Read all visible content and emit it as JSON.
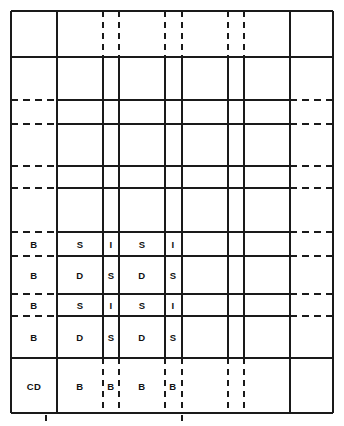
{
  "figure": {
    "title": "",
    "type": "grid-schedule-diagram",
    "width": 344,
    "height": 426,
    "background_color": "#ffffff",
    "line_color": "#1a1a1a",
    "text_color": "#111111"
  },
  "geometry": {
    "border": {
      "x0": 11,
      "y0": 11,
      "x1": 333,
      "y1": 413
    },
    "vertical_lines_x": [
      11,
      57,
      103,
      119,
      165,
      182,
      228,
      244,
      290,
      333
    ],
    "horizontal_lines_y": [
      11,
      57,
      100,
      124,
      166,
      188,
      232,
      256,
      294,
      316,
      358,
      413
    ]
  },
  "columns": [
    {
      "name": "col-1",
      "x0": 11,
      "x1": 57
    },
    {
      "name": "col-2",
      "x0": 57,
      "x1": 103
    },
    {
      "name": "col-3",
      "x0": 103,
      "x1": 119
    },
    {
      "name": "col-4",
      "x0": 119,
      "x1": 165
    },
    {
      "name": "col-5",
      "x0": 165,
      "x1": 182
    },
    {
      "name": "col-6",
      "x0": 182,
      "x1": 228
    },
    {
      "name": "col-7",
      "x0": 228,
      "x1": 244
    },
    {
      "name": "col-8",
      "x0": 244,
      "x1": 290
    },
    {
      "name": "col-9",
      "x0": 290,
      "x1": 333
    }
  ],
  "rows": [
    {
      "name": "row-1",
      "y0": 11,
      "y1": 57
    },
    {
      "name": "row-2",
      "y0": 57,
      "y1": 100
    },
    {
      "name": "row-3",
      "y0": 100,
      "y1": 124
    },
    {
      "name": "row-4",
      "y0": 124,
      "y1": 166
    },
    {
      "name": "row-5",
      "y0": 166,
      "y1": 188
    },
    {
      "name": "row-6",
      "y0": 188,
      "y1": 232
    },
    {
      "name": "row-7",
      "y0": 232,
      "y1": 256
    },
    {
      "name": "row-8",
      "y0": 256,
      "y1": 294
    },
    {
      "name": "row-9",
      "y0": 294,
      "y1": 316
    },
    {
      "name": "row-10",
      "y0": 316,
      "y1": 358
    },
    {
      "name": "row-11",
      "y0": 358,
      "y1": 413
    }
  ],
  "labels": [
    {
      "text": "B",
      "cx": 34,
      "cy": 244
    },
    {
      "text": "S",
      "cx": 80,
      "cy": 244
    },
    {
      "text": "I",
      "cx": 111,
      "cy": 244
    },
    {
      "text": "S",
      "cx": 142,
      "cy": 244
    },
    {
      "text": "I",
      "cx": 173,
      "cy": 244
    },
    {
      "text": "B",
      "cx": 34,
      "cy": 275
    },
    {
      "text": "D",
      "cx": 80,
      "cy": 275
    },
    {
      "text": "S",
      "cx": 111,
      "cy": 275
    },
    {
      "text": "D",
      "cx": 142,
      "cy": 275
    },
    {
      "text": "S",
      "cx": 173,
      "cy": 275
    },
    {
      "text": "B",
      "cx": 34,
      "cy": 305
    },
    {
      "text": "S",
      "cx": 80,
      "cy": 305
    },
    {
      "text": "I",
      "cx": 111,
      "cy": 305
    },
    {
      "text": "S",
      "cx": 142,
      "cy": 305
    },
    {
      "text": "I",
      "cx": 173,
      "cy": 305
    },
    {
      "text": "B",
      "cx": 34,
      "cy": 337
    },
    {
      "text": "D",
      "cx": 80,
      "cy": 337
    },
    {
      "text": "S",
      "cx": 111,
      "cy": 337
    },
    {
      "text": "D",
      "cx": 142,
      "cy": 337
    },
    {
      "text": "S",
      "cx": 173,
      "cy": 337
    },
    {
      "text": "CD",
      "cx": 34,
      "cy": 386
    },
    {
      "text": "B",
      "cx": 80,
      "cy": 386
    },
    {
      "text": "B",
      "cx": 111,
      "cy": 386
    },
    {
      "text": "B",
      "cx": 142,
      "cy": 386
    },
    {
      "text": "B",
      "cx": 173,
      "cy": 386
    }
  ],
  "strokes": {
    "solid_horizontals": [
      {
        "name": "border-top",
        "x0": 11,
        "x1": 333,
        "y": 11
      },
      {
        "name": "band1-bottom",
        "x0": 11,
        "x1": 333,
        "y": 57
      },
      {
        "name": "h-100-mid",
        "x0": 57,
        "x1": 290,
        "y": 100
      },
      {
        "name": "h-124-mid",
        "x0": 57,
        "x1": 290,
        "y": 124
      },
      {
        "name": "h-166-mid",
        "x0": 57,
        "x1": 290,
        "y": 166
      },
      {
        "name": "h-188-mid",
        "x0": 57,
        "x1": 290,
        "y": 188
      },
      {
        "name": "h-232-mid",
        "x0": 57,
        "x1": 290,
        "y": 232
      },
      {
        "name": "h-256-mid",
        "x0": 57,
        "x1": 290,
        "y": 256
      },
      {
        "name": "h-294-mid",
        "x0": 57,
        "x1": 290,
        "y": 294
      },
      {
        "name": "h-316-mid",
        "x0": 57,
        "x1": 290,
        "y": 316
      },
      {
        "name": "h-358-full",
        "x0": 11,
        "x1": 333,
        "y": 358
      },
      {
        "name": "border-bottom",
        "x0": 11,
        "x1": 333,
        "y": 413
      }
    ],
    "dashed_horizontals": [
      {
        "name": "d-100-left",
        "x0": 11,
        "x1": 57,
        "y": 100
      },
      {
        "name": "d-100-right",
        "x0": 290,
        "x1": 333,
        "y": 100
      },
      {
        "name": "d-124-left",
        "x0": 11,
        "x1": 57,
        "y": 124
      },
      {
        "name": "d-124-right",
        "x0": 290,
        "x1": 333,
        "y": 124
      },
      {
        "name": "d-166-left",
        "x0": 11,
        "x1": 57,
        "y": 166
      },
      {
        "name": "d-166-right",
        "x0": 290,
        "x1": 333,
        "y": 166
      },
      {
        "name": "d-188-left",
        "x0": 11,
        "x1": 57,
        "y": 188
      },
      {
        "name": "d-188-right",
        "x0": 290,
        "x1": 333,
        "y": 188
      },
      {
        "name": "d-232-left",
        "x0": 11,
        "x1": 57,
        "y": 232
      },
      {
        "name": "d-232-right",
        "x0": 290,
        "x1": 333,
        "y": 232
      },
      {
        "name": "d-256-left",
        "x0": 11,
        "x1": 57,
        "y": 256
      },
      {
        "name": "d-256-right",
        "x0": 290,
        "x1": 333,
        "y": 256
      },
      {
        "name": "d-294-left",
        "x0": 11,
        "x1": 57,
        "y": 294
      },
      {
        "name": "d-294-right",
        "x0": 290,
        "x1": 333,
        "y": 294
      },
      {
        "name": "d-316-left",
        "x0": 11,
        "x1": 57,
        "y": 316
      },
      {
        "name": "d-316-right",
        "x0": 290,
        "x1": 333,
        "y": 316
      }
    ],
    "solid_verticals": [
      {
        "name": "border-left",
        "x": 11,
        "y0": 11,
        "y1": 413
      },
      {
        "name": "v-57",
        "x": 57,
        "y0": 11,
        "y1": 413
      },
      {
        "name": "v-103",
        "x": 103,
        "y0": 57,
        "y1": 358
      },
      {
        "name": "v-119",
        "x": 119,
        "y0": 57,
        "y1": 358
      },
      {
        "name": "v-165",
        "x": 165,
        "y0": 57,
        "y1": 358
      },
      {
        "name": "v-182",
        "x": 182,
        "y0": 57,
        "y1": 358
      },
      {
        "name": "v-228",
        "x": 228,
        "y0": 57,
        "y1": 358
      },
      {
        "name": "v-244",
        "x": 244,
        "y0": 57,
        "y1": 358
      },
      {
        "name": "v-290",
        "x": 290,
        "y0": 11,
        "y1": 413
      },
      {
        "name": "border-right",
        "x": 333,
        "y0": 11,
        "y1": 413
      }
    ],
    "dashed_verticals": [
      {
        "name": "dv-103-top",
        "x": 103,
        "y0": 11,
        "y1": 57
      },
      {
        "name": "dv-119-top",
        "x": 119,
        "y0": 11,
        "y1": 57
      },
      {
        "name": "dv-165-top",
        "x": 165,
        "y0": 11,
        "y1": 57
      },
      {
        "name": "dv-182-top",
        "x": 182,
        "y0": 11,
        "y1": 57
      },
      {
        "name": "dv-228-top",
        "x": 228,
        "y0": 11,
        "y1": 57
      },
      {
        "name": "dv-244-top",
        "x": 244,
        "y0": 11,
        "y1": 57
      },
      {
        "name": "dv-103-bot",
        "x": 103,
        "y0": 358,
        "y1": 413
      },
      {
        "name": "dv-119-bot",
        "x": 119,
        "y0": 358,
        "y1": 413
      },
      {
        "name": "dv-165-bot",
        "x": 165,
        "y0": 358,
        "y1": 413
      },
      {
        "name": "dv-182-bot",
        "x": 182,
        "y0": 358,
        "y1": 413
      },
      {
        "name": "dv-228-bot",
        "x": 228,
        "y0": 358,
        "y1": 413
      },
      {
        "name": "dv-244-bot",
        "x": 244,
        "y0": 358,
        "y1": 413
      }
    ],
    "tick_marks": [
      {
        "name": "tick-a",
        "x": 46,
        "y0": 415,
        "y1": 421
      },
      {
        "name": "tick-b",
        "x": 182,
        "y0": 415,
        "y1": 421
      }
    ]
  }
}
